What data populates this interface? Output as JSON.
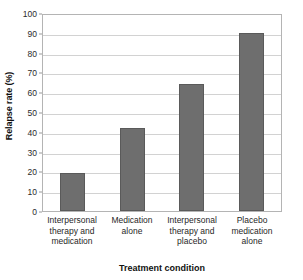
{
  "chart_data": {
    "type": "bar",
    "title": "",
    "xlabel": "Treatment condition",
    "ylabel": "Relapse rate (%)",
    "categories": [
      "Interpersonal therapy and medication",
      "Medication alone",
      "Interpersonal therapy and placebo",
      "Placebo medication alone"
    ],
    "category_lines": [
      [
        "Interpersonal",
        "therapy and",
        "medication"
      ],
      [
        "Medication",
        "alone"
      ],
      [
        "Interpersonal",
        "therapy and",
        "placebo"
      ],
      [
        "Placebo",
        "medication",
        "alone"
      ]
    ],
    "values": [
      19,
      42,
      64,
      90
    ],
    "ylim": [
      0,
      100
    ],
    "ytick_values": [
      0,
      10,
      20,
      30,
      40,
      50,
      60,
      70,
      80,
      90,
      100
    ],
    "ytick_labels": [
      "0",
      "10",
      "20",
      "30",
      "40",
      "50",
      "60",
      "70",
      "80",
      "90",
      "100"
    ],
    "grid": true,
    "legend": false,
    "bar_color": "#6e6e6e",
    "bar_border_color": "#5a5a5a",
    "gridline_color": "#d2d2d2",
    "plot_border_color": "#b4b4b4",
    "background_color": "#ffffff"
  }
}
